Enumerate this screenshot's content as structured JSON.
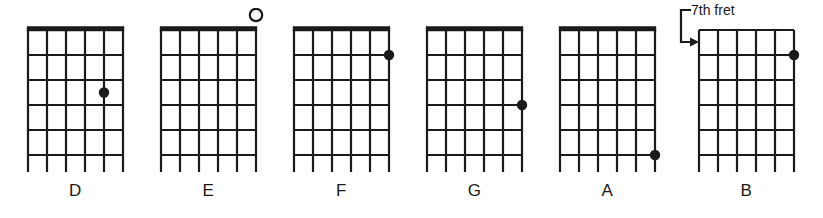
{
  "figure": {
    "kind": "guitar-chord-diagram-row",
    "background_color": "#ffffff",
    "ink_color": "#1a1a1a",
    "string_count": 6,
    "fret_count": 5
  },
  "annotation": {
    "fret_label": "7th fret",
    "points_to": "B"
  },
  "chords": [
    {
      "name": "D",
      "label": "D",
      "open_position": true,
      "nut": "thick",
      "markers": [
        {
          "type": "dot",
          "string": 5,
          "fret": 3,
          "on_line": false
        }
      ],
      "open_strings": []
    },
    {
      "name": "E",
      "label": "E",
      "open_position": true,
      "nut": "thick",
      "markers": [],
      "open_strings": [
        6
      ]
    },
    {
      "name": "F",
      "label": "F",
      "open_position": true,
      "nut": "thick",
      "markers": [
        {
          "type": "dot",
          "string": 6,
          "fret": 1,
          "on_line": true
        }
      ],
      "open_strings": []
    },
    {
      "name": "G",
      "label": "G",
      "open_position": true,
      "nut": "thick",
      "markers": [
        {
          "type": "dot",
          "string": 6,
          "fret": 3,
          "on_line": true
        }
      ],
      "open_strings": []
    },
    {
      "name": "A",
      "label": "A",
      "open_position": true,
      "nut": "thick",
      "markers": [
        {
          "type": "dot",
          "string": 6,
          "fret": 5,
          "on_line": true
        }
      ],
      "open_strings": []
    },
    {
      "name": "B",
      "label": "B",
      "open_position": false,
      "nut": "thin",
      "start_fret_label": "7th fret",
      "markers": [
        {
          "type": "dot",
          "string": 6,
          "fret": 1,
          "on_line": true
        }
      ],
      "open_strings": []
    }
  ]
}
